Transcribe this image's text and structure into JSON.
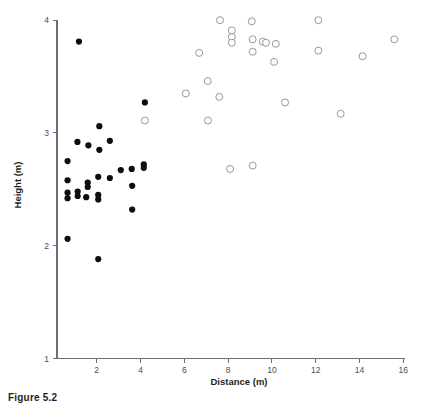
{
  "figure": {
    "caption": "Figure 5.2"
  },
  "chart_data": {
    "type": "scatter",
    "title": "",
    "xlabel": "Distance (m)",
    "ylabel": "Height (m)",
    "xlim": [
      0,
      16.2
    ],
    "ylim": [
      1,
      4.03
    ],
    "xticks": [
      2,
      4,
      6,
      8,
      10,
      12,
      14,
      16
    ],
    "xtick_labels": [
      "2",
      "4",
      "6",
      "8",
      "10",
      "12",
      "14",
      "16"
    ],
    "yticks": [
      1,
      2,
      3,
      4
    ],
    "ytick_labels": [
      "1",
      "2",
      "3",
      "4"
    ],
    "grid": false,
    "legend": "none",
    "series": [
      {
        "name": "filled",
        "marker": "filled-circle",
        "color": "#0d0d0d",
        "marker_size": 6.2,
        "points": [
          [
            1.19,
            3.81
          ],
          [
            1.12,
            2.92
          ],
          [
            1.62,
            2.89
          ],
          [
            2.12,
            3.06
          ],
          [
            2.12,
            2.85
          ],
          [
            2.6,
            2.93
          ],
          [
            4.2,
            3.27
          ],
          [
            2.6,
            2.6
          ],
          [
            0.67,
            2.75
          ],
          [
            0.67,
            2.58
          ],
          [
            0.67,
            2.47
          ],
          [
            0.67,
            2.42
          ],
          [
            1.13,
            2.48
          ],
          [
            1.13,
            2.44
          ],
          [
            1.59,
            2.56
          ],
          [
            1.59,
            2.52
          ],
          [
            1.52,
            2.43
          ],
          [
            2.07,
            2.61
          ],
          [
            2.07,
            2.45
          ],
          [
            2.07,
            2.41
          ],
          [
            3.1,
            2.67
          ],
          [
            3.6,
            2.68
          ],
          [
            4.15,
            2.72
          ],
          [
            4.15,
            2.69
          ],
          [
            3.62,
            2.53
          ],
          [
            3.62,
            2.32
          ],
          [
            0.67,
            2.06
          ],
          [
            2.07,
            1.88
          ]
        ]
      },
      {
        "name": "open",
        "marker": "open-circle",
        "color": "#8c8c8c",
        "marker_size": 7.0,
        "points": [
          [
            7.63,
            4.0
          ],
          [
            9.08,
            3.99
          ],
          [
            12.12,
            4.0
          ],
          [
            8.17,
            3.91
          ],
          [
            8.17,
            3.85
          ],
          [
            8.17,
            3.8
          ],
          [
            9.12,
            3.83
          ],
          [
            9.58,
            3.81
          ],
          [
            9.73,
            3.8
          ],
          [
            10.18,
            3.79
          ],
          [
            9.12,
            3.72
          ],
          [
            6.68,
            3.71
          ],
          [
            12.12,
            3.73
          ],
          [
            14.14,
            3.68
          ],
          [
            15.59,
            3.83
          ],
          [
            10.1,
            3.63
          ],
          [
            7.07,
            3.46
          ],
          [
            6.07,
            3.35
          ],
          [
            7.6,
            3.32
          ],
          [
            10.6,
            3.27
          ],
          [
            13.14,
            3.17
          ],
          [
            7.08,
            3.11
          ],
          [
            4.2,
            3.11
          ],
          [
            8.09,
            2.68
          ],
          [
            9.12,
            2.71
          ]
        ]
      }
    ]
  }
}
